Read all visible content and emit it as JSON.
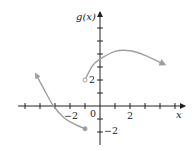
{
  "chart_data": {
    "type": "line",
    "title": "",
    "xlabel": "x",
    "ylabel": "g(x)",
    "xlim": [
      -5.5,
      5.5
    ],
    "ylim": [
      -2.5,
      6.8
    ],
    "x_ticks": [
      -5,
      -4,
      -3,
      -2,
      -1,
      1,
      2,
      3,
      4,
      5
    ],
    "y_ticks": [
      -2,
      -1,
      1,
      2,
      3,
      4,
      5,
      6
    ],
    "x_tick_labels": [
      {
        "value": -2,
        "label": "−2"
      },
      {
        "value": 0,
        "label": "0"
      },
      {
        "value": 2,
        "label": "2"
      }
    ],
    "y_tick_labels": [
      {
        "value": 2,
        "label": "2"
      },
      {
        "value": -2,
        "label": "−2"
      }
    ],
    "grid": false,
    "color": "#9e9e9e",
    "series": [
      {
        "name": "left-piece",
        "points": [
          [
            -4.3,
            2.5
          ],
          [
            -3.6,
            1.0
          ],
          [
            -3.1,
            0
          ],
          [
            -2.4,
            -0.9
          ],
          [
            -1.7,
            -1.4
          ],
          [
            -1,
            -1.75
          ]
        ],
        "start": "arrow",
        "end": "closed-dot"
      },
      {
        "name": "right-piece",
        "points": [
          [
            -1,
            2
          ],
          [
            -0.5,
            3.1
          ],
          [
            0,
            3.6
          ],
          [
            1,
            4.2
          ],
          [
            2,
            4.25
          ],
          [
            3,
            3.9
          ],
          [
            4.3,
            3.2
          ]
        ],
        "start": "open-dot",
        "end": "arrow"
      }
    ]
  },
  "labels": {
    "y_axis": "g(x)",
    "x_axis": "x",
    "origin": "0",
    "x_neg2": "−2",
    "x_pos2": "2",
    "y_pos2": "2",
    "y_neg2": "−2"
  }
}
